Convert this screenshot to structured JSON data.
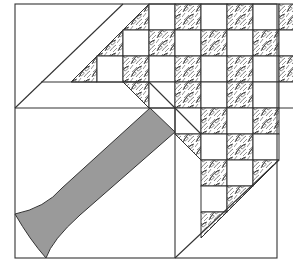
{
  "diagram": {
    "type": "quilt-block",
    "colors": {
      "background": "#ffffff",
      "line": "#333333",
      "handle_fill": "#9a9a9a",
      "print_base": "#ffffff",
      "print_ink": "#2a2a2a"
    },
    "outer_square": {
      "x": 15,
      "y": 4,
      "w": 262,
      "h": 254
    },
    "grid": {
      "origin_x": 19,
      "origin_y": 4,
      "cell": 26
    },
    "cells": [
      {
        "r": 0,
        "c": 4,
        "kind": "tri-br"
      },
      {
        "r": 0,
        "c": 5,
        "kind": "white"
      },
      {
        "r": 0,
        "c": 6,
        "kind": "print"
      },
      {
        "r": 0,
        "c": 7,
        "kind": "white"
      },
      {
        "r": 0,
        "c": 8,
        "kind": "print"
      },
      {
        "r": 0,
        "c": 9,
        "kind": "white"
      },
      {
        "r": 0,
        "c": 10,
        "kind": "print"
      },
      {
        "r": 1,
        "c": 3,
        "kind": "tri-br"
      },
      {
        "r": 1,
        "c": 4,
        "kind": "white"
      },
      {
        "r": 1,
        "c": 5,
        "kind": "print"
      },
      {
        "r": 1,
        "c": 6,
        "kind": "white"
      },
      {
        "r": 1,
        "c": 7,
        "kind": "print"
      },
      {
        "r": 1,
        "c": 8,
        "kind": "white"
      },
      {
        "r": 1,
        "c": 9,
        "kind": "print"
      },
      {
        "r": 1,
        "c": 10,
        "kind": "white"
      },
      {
        "r": 2,
        "c": 2,
        "kind": "tri-br"
      },
      {
        "r": 2,
        "c": 3,
        "kind": "white"
      },
      {
        "r": 2,
        "c": 4,
        "kind": "print"
      },
      {
        "r": 2,
        "c": 5,
        "kind": "white"
      },
      {
        "r": 2,
        "c": 6,
        "kind": "print"
      },
      {
        "r": 2,
        "c": 7,
        "kind": "white"
      },
      {
        "r": 2,
        "c": 8,
        "kind": "print"
      },
      {
        "r": 2,
        "c": 9,
        "kind": "white"
      },
      {
        "r": 2,
        "c": 10,
        "kind": "print"
      },
      {
        "r": 3,
        "c": 4,
        "kind": "tri-tr"
      },
      {
        "r": 3,
        "c": 5,
        "kind": "white"
      },
      {
        "r": 3,
        "c": 6,
        "kind": "print"
      },
      {
        "r": 3,
        "c": 7,
        "kind": "white"
      },
      {
        "r": 3,
        "c": 8,
        "kind": "print"
      },
      {
        "r": 3,
        "c": 9,
        "kind": "white"
      },
      {
        "r": 3,
        "c": 10,
        "kind": "white"
      },
      {
        "r": 4,
        "c": 6,
        "kind": "white"
      },
      {
        "r": 4,
        "c": 7,
        "kind": "print"
      },
      {
        "r": 4,
        "c": 8,
        "kind": "white"
      },
      {
        "r": 4,
        "c": 9,
        "kind": "print"
      },
      {
        "r": 5,
        "c": 6,
        "kind": "tri-tr"
      },
      {
        "r": 5,
        "c": 7,
        "kind": "white"
      },
      {
        "r": 5,
        "c": 8,
        "kind": "print"
      },
      {
        "r": 5,
        "c": 9,
        "kind": "white"
      },
      {
        "r": 6,
        "c": 7,
        "kind": "print"
      },
      {
        "r": 6,
        "c": 8,
        "kind": "white"
      },
      {
        "r": 6,
        "c": 9,
        "kind": "tri-tl"
      },
      {
        "r": 7,
        "c": 7,
        "kind": "white"
      },
      {
        "r": 7,
        "c": 8,
        "kind": "tri-tl"
      },
      {
        "r": 8,
        "c": 7,
        "kind": "tri-tl"
      }
    ],
    "handle": {
      "points": "M 15 214 Q 45 208 62 188 L 150 108 L 175 132 L 80 215 Q 52 240 46 258 Q 30 240 15 214 Z"
    }
  }
}
